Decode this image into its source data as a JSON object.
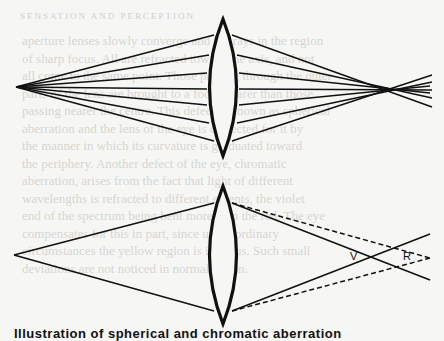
{
  "page": {
    "bleed_header": "SENSATION AND PERCEPTION",
    "bleed_lines": [
      "aperture lenses slowly converge and the rays in the region",
      "of sharp focus. All are refracted toward the axis, and not",
      "all come to the same point. Those passing through the outer",
      "parts of the lens are brought to a focus nearer than those",
      "passing nearer the centre. This defect is known as spherical",
      "aberration and the lens of the eye is corrected for it by",
      "the manner in which its curvature is graduated toward",
      "the periphery. Another defect of the eye, chromatic",
      "aberration, arises from the fact that light of different",
      "wavelengths is refracted to different extents, the violet",
      "end of the spectrum being bent more than the red. The eye",
      "compensates for this in part, since under ordinary",
      "circumstances the yellow region is in focus. Such small",
      "deviations are not noticed in normal vision."
    ]
  },
  "diagrams": {
    "top": {
      "title": "spherical-aberration",
      "source_point": [
        16,
        87
      ],
      "lens_center_x": 223,
      "ray_count": 8,
      "focus_region_x": 390
    },
    "bottom": {
      "title": "chromatic-aberration",
      "source_point": [
        16,
        255
      ],
      "lens_center_x": 223,
      "labels": {
        "violet": "V",
        "red": "R"
      }
    }
  },
  "caption": "Illustration of spherical and chromatic aberration"
}
